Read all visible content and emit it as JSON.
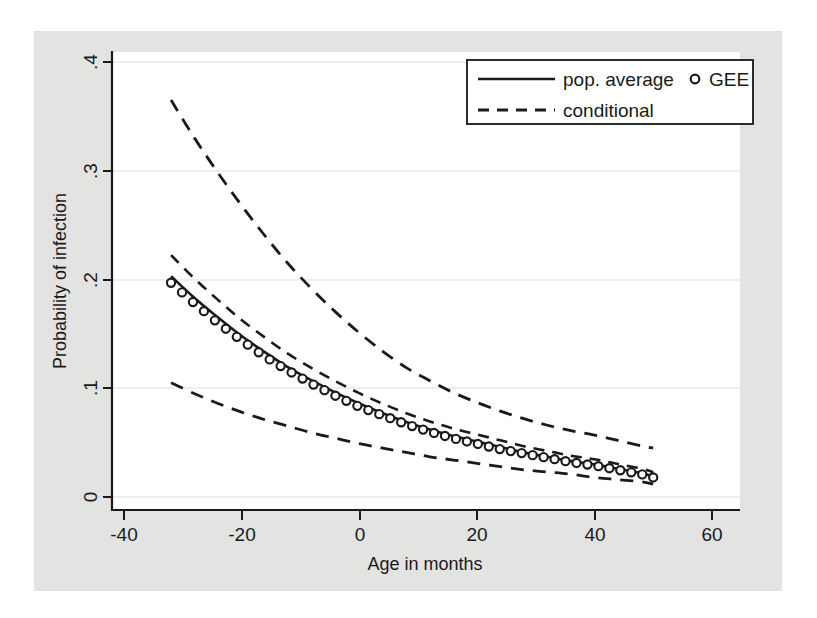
{
  "figure": {
    "background_color": "#e3e3e2",
    "plot_area_color": "#ffffff",
    "axis_color": "#1a1a1a",
    "grid_color": "#e8e8e8"
  },
  "chart_data": {
    "type": "line",
    "title": "",
    "xlabel": "Age in months",
    "ylabel": "Probability of infection",
    "xlim": [
      -45,
      62
    ],
    "ylim": [
      0,
      0.41
    ],
    "xticks": [
      -40,
      -20,
      0,
      20,
      40,
      60
    ],
    "xticklabels": [
      "-40",
      "-20",
      "0",
      "20",
      "40",
      "60"
    ],
    "yticks": [
      0,
      0.1,
      0.2,
      0.3,
      0.4
    ],
    "yticklabels": [
      "0",
      ".1",
      ".2",
      ".3",
      ".4"
    ],
    "grid": "horizontal",
    "legend_position": "top-right",
    "legend_entries": [
      {
        "label": "pop. average",
        "style": "solid-line"
      },
      {
        "label": "GEE",
        "style": "circle-marker"
      },
      {
        "label": "conditional",
        "style": "dashed-line"
      }
    ],
    "x": [
      -32,
      -28,
      -24,
      -20,
      -16,
      -12,
      -8,
      -4,
      0,
      4,
      8,
      12,
      16,
      20,
      24,
      28,
      32,
      36,
      40,
      44,
      48,
      50
    ],
    "series": [
      {
        "name": "conditional (upper)",
        "style": "dashed",
        "values": [
          0.365,
          0.33,
          0.298,
          0.268,
          0.24,
          0.214,
          0.191,
          0.17,
          0.151,
          0.134,
          0.119,
          0.107,
          0.096,
          0.087,
          0.079,
          0.072,
          0.066,
          0.061,
          0.057,
          0.052,
          0.047,
          0.045
        ]
      },
      {
        "name": "pop. average",
        "style": "solid",
        "values": [
          0.203,
          0.183,
          0.165,
          0.148,
          0.133,
          0.119,
          0.107,
          0.096,
          0.086,
          0.077,
          0.069,
          0.062,
          0.056,
          0.051,
          0.046,
          0.041,
          0.037,
          0.033,
          0.03,
          0.026,
          0.022,
          0.019
        ]
      },
      {
        "name": "GEE",
        "style": "markers",
        "values": [
          0.197,
          0.178,
          0.16,
          0.144,
          0.129,
          0.116,
          0.104,
          0.093,
          0.083,
          0.075,
          0.067,
          0.06,
          0.054,
          0.049,
          0.044,
          0.04,
          0.036,
          0.032,
          0.029,
          0.025,
          0.021,
          0.018
        ]
      },
      {
        "name": "conditional (lower)",
        "style": "dashed",
        "values": [
          0.105,
          0.095,
          0.086,
          0.078,
          0.071,
          0.065,
          0.059,
          0.054,
          0.049,
          0.045,
          0.041,
          0.037,
          0.034,
          0.031,
          0.028,
          0.025,
          0.023,
          0.021,
          0.018,
          0.016,
          0.014,
          0.012
        ]
      }
    ]
  }
}
